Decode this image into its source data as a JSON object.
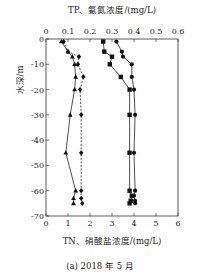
{
  "caption": "(a) 2018 年 5 月",
  "chart_data": {
    "type": "line",
    "title": "",
    "top_axis": {
      "label": "TP、氨氮浓度/(mg/L)",
      "ticks": [
        "0",
        "0.1",
        "0.2",
        "0.3",
        "0.4",
        "0.5",
        "0.6"
      ],
      "range": [
        0,
        0.6
      ]
    },
    "bottom_axis": {
      "label": "TN、硝酸盐浓度/(mg/L)",
      "ticks": [
        "0",
        "1",
        "2",
        "3",
        "4",
        "5",
        "6"
      ],
      "range": [
        0,
        6
      ]
    },
    "ylabel": "水深/m",
    "y_ticks": [
      "0",
      "-10",
      "-20",
      "-30",
      "-40",
      "-50",
      "-60",
      "-70"
    ],
    "ylim": [
      -70,
      0
    ],
    "grid": false,
    "series": [
      {
        "name": "TP",
        "axis": "top",
        "marker": "triangle",
        "line": "solid",
        "depth": [
          -1,
          -5,
          -7,
          -10,
          -15,
          -20,
          -30,
          -45,
          -60,
          -63,
          -65
        ],
        "values": [
          0.07,
          0.1,
          0.12,
          0.13,
          0.135,
          0.13,
          0.11,
          0.09,
          0.135,
          0.125,
          0.125
        ]
      },
      {
        "name": "氨氮",
        "axis": "top",
        "marker": "diamond",
        "line": "dashed",
        "depth": [
          -1,
          -5,
          -7,
          -10,
          -15,
          -20,
          -30,
          -45,
          -60,
          -63,
          -65
        ],
        "values": [
          0.08,
          0.1,
          0.15,
          0.145,
          0.17,
          0.155,
          0.16,
          0.16,
          0.16,
          0.16,
          0.165
        ]
      },
      {
        "name": "硝酸盐",
        "axis": "bottom",
        "marker": "square",
        "line": "solid",
        "depth": [
          -1,
          -5,
          -7,
          -10,
          -15,
          -20,
          -30,
          -45,
          -60,
          -62,
          -64,
          -65
        ],
        "values": [
          2.6,
          2.65,
          3.0,
          2.9,
          3.4,
          3.8,
          3.8,
          3.8,
          3.8,
          3.9,
          3.85,
          3.8
        ]
      },
      {
        "name": "TN",
        "axis": "bottom",
        "marker": "circle",
        "line": "solid",
        "depth": [
          -1,
          -5,
          -7,
          -10,
          -15,
          -20,
          -30,
          -45,
          -60,
          -62,
          -64,
          -65
        ],
        "values": [
          3.2,
          3.45,
          3.5,
          3.9,
          3.9,
          4.0,
          4.05,
          4.0,
          4.05,
          4.0,
          4.05,
          4.05
        ]
      }
    ]
  }
}
